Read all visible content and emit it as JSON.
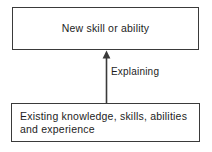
{
  "diagram": {
    "type": "flow-diagram",
    "background_color": "#ffffff",
    "line_color": "#3a3a3a",
    "text_color": "#1d1d1d",
    "top_box": {
      "label": "New skill or ability",
      "align": "center"
    },
    "bottom_box": {
      "label": "Existing knowledge, skills, abilities\nand experience",
      "align": "left"
    },
    "arrow": {
      "label": "Explaining",
      "direction": "up",
      "from": "bottom_box",
      "to": "top_box"
    }
  }
}
